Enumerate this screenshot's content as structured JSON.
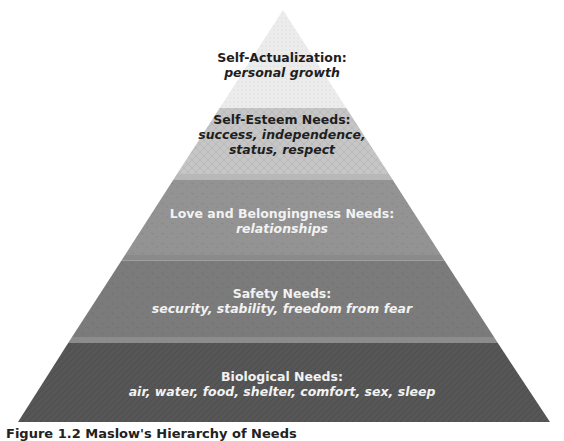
{
  "diagram": {
    "type": "pyramid",
    "levels": [
      {
        "title": "Self-Actualization:",
        "sub": "personal growth",
        "color": "#ececec"
      },
      {
        "title": "Self-Esteem Needs:",
        "sub": "success, independence,",
        "sub2": "status, respect",
        "color": "#c6c6c6"
      },
      {
        "title": "Love and Belongingness Needs:",
        "sub": "relationships",
        "color": "#939393"
      },
      {
        "title": "Safety Needs:",
        "sub": "security, stability, freedom from fear",
        "color": "#7b7b7b"
      },
      {
        "title": "Biological Needs:",
        "sub": "air, water, food, shelter, comfort, sex, sleep",
        "color": "#565656"
      }
    ]
  },
  "caption": "Figure 1.2 Maslow's Hierarchy of Needs"
}
